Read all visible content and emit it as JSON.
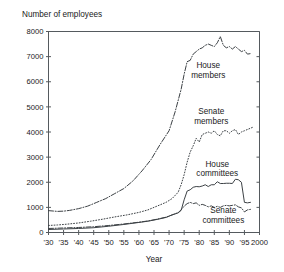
{
  "chart_data": {
    "type": "line",
    "title": "Number of employees",
    "xlabel": "Year",
    "ylabel": "Number of employees",
    "xlim": [
      1930,
      2000
    ],
    "ylim": [
      0,
      8000
    ],
    "grid": false,
    "legend": "inline-annotations",
    "y_ticks": [
      0,
      1000,
      2000,
      3000,
      4000,
      5000,
      6000,
      7000,
      8000
    ],
    "y_tick_labels": [
      "0",
      "1000",
      "2000",
      "3000",
      "4000",
      "5000",
      "6000",
      "7000",
      "8000"
    ],
    "x_ticks": [
      1930,
      1935,
      1940,
      1945,
      1950,
      1955,
      1960,
      1965,
      1970,
      1975,
      1980,
      1985,
      1990,
      1995,
      2000
    ],
    "x_tick_labels": [
      "'30",
      "'35",
      "'40",
      "'45",
      "'50",
      "'55",
      "'60",
      "'65",
      "'70",
      "'75",
      "'80",
      "'85",
      "'90",
      "'95",
      "2000"
    ],
    "series": [
      {
        "name": "House members",
        "style": "dash-dot",
        "color": "#3c4145",
        "label_position": {
          "x": 1983,
          "y": 6550
        },
        "x": [
          1930,
          1933,
          1935,
          1937,
          1940,
          1943,
          1946,
          1949,
          1952,
          1955,
          1958,
          1961,
          1964,
          1967,
          1970,
          1972,
          1974,
          1975,
          1976,
          1977,
          1978,
          1979,
          1980,
          1981,
          1982,
          1983,
          1984,
          1985,
          1986,
          1987,
          1988,
          1989,
          1990,
          1991,
          1992,
          1993,
          1994,
          1995,
          1996,
          1997
        ],
        "y": [
          870,
          840,
          850,
          880,
          950,
          1050,
          1200,
          1350,
          1550,
          1750,
          2050,
          2450,
          2900,
          3500,
          4050,
          4800,
          5700,
          6300,
          6800,
          6850,
          7100,
          7200,
          7300,
          7350,
          7450,
          7500,
          7450,
          7400,
          7550,
          7800,
          7450,
          7350,
          7400,
          7300,
          7400,
          7300,
          7200,
          7250,
          7100,
          7120
        ]
      },
      {
        "name": "Senate members",
        "style": "dotted",
        "color": "#3c4145",
        "label_position": {
          "x": 1984,
          "y": 4700
        },
        "x": [
          1930,
          1933,
          1936,
          1940,
          1944,
          1948,
          1952,
          1956,
          1960,
          1963,
          1966,
          1969,
          1971,
          1973,
          1974,
          1975,
          1976,
          1977,
          1978,
          1979,
          1980,
          1981,
          1982,
          1983,
          1984,
          1985,
          1986,
          1987,
          1988,
          1989,
          1990,
          1991,
          1992,
          1993,
          1994,
          1995,
          1996,
          1997,
          1998
        ],
        "y": [
          280,
          300,
          330,
          380,
          450,
          530,
          620,
          700,
          800,
          900,
          1050,
          1200,
          1350,
          1600,
          1900,
          2300,
          2800,
          3200,
          3450,
          3750,
          3600,
          3900,
          3950,
          4000,
          3950,
          4050,
          3900,
          3850,
          4050,
          4050,
          3950,
          4050,
          4100,
          3900,
          4000,
          4050,
          4100,
          4150,
          4200
        ]
      },
      {
        "name": "House committees",
        "style": "solid",
        "color": "#3c4145",
        "label_position": {
          "x": 1986,
          "y": 2620
        },
        "x": [
          1930,
          1935,
          1940,
          1945,
          1950,
          1955,
          1960,
          1963,
          1966,
          1969,
          1971,
          1973,
          1974,
          1975,
          1976,
          1977,
          1978,
          1979,
          1980,
          1981,
          1982,
          1983,
          1984,
          1985,
          1986,
          1987,
          1988,
          1989,
          1990,
          1991,
          1992,
          1993,
          1994,
          1995,
          1996,
          1997
        ],
        "y": [
          120,
          140,
          160,
          190,
          250,
          320,
          400,
          450,
          520,
          600,
          700,
          780,
          880,
          1300,
          1650,
          1700,
          1800,
          1830,
          1820,
          1850,
          1900,
          1830,
          1900,
          1900,
          2020,
          1950,
          1950,
          1960,
          1960,
          1950,
          2120,
          2100,
          2000,
          1200,
          1180,
          1200
        ]
      },
      {
        "name": "Senate committees",
        "style": "dash-dot",
        "color": "#3c4145",
        "label_position": {
          "x": 1988,
          "y": 760
        },
        "x": [
          1930,
          1935,
          1940,
          1945,
          1950,
          1955,
          1960,
          1963,
          1966,
          1969,
          1971,
          1973,
          1974,
          1975,
          1976,
          1977,
          1978,
          1979,
          1980,
          1981,
          1982,
          1983,
          1984,
          1985,
          1986,
          1987,
          1988,
          1989,
          1990,
          1991,
          1992,
          1993,
          1994,
          1995,
          1996,
          1997
        ],
        "y": [
          160,
          180,
          200,
          230,
          280,
          340,
          410,
          460,
          530,
          610,
          700,
          790,
          900,
          1050,
          1150,
          1200,
          1150,
          1180,
          1080,
          1120,
          1080,
          1020,
          1060,
          1000,
          1040,
          1000,
          1060,
          1080,
          1060,
          1080,
          1100,
          1020,
          980,
          820,
          900,
          920
        ]
      }
    ]
  }
}
